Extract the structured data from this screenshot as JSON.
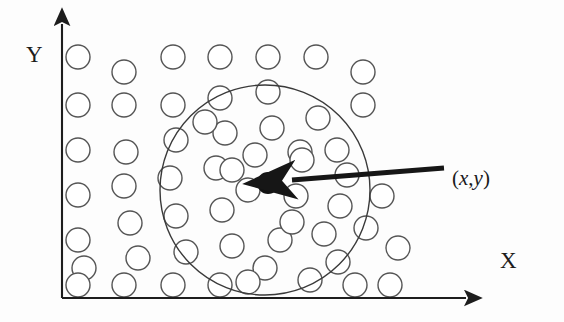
{
  "figure": {
    "type": "scatter-diagram",
    "title": "",
    "background_color": "#fdfdfd",
    "ink_color": "#2b2b2b",
    "axes": {
      "x_label": "X",
      "y_label": "Y",
      "origin": [
        62,
        298
      ],
      "x_axis_end": [
        472,
        298
      ],
      "y_axis_end": [
        62,
        18
      ],
      "arrowheads": "both-ends-outward",
      "color": "#1d1d1d"
    },
    "annotation": {
      "point_label": "(x,y)",
      "label_open_paren": "(",
      "label_x": "x",
      "label_comma": ",",
      "label_y": "y",
      "label_close_paren": ")",
      "arrow_from": [
        444,
        168
      ],
      "arrow_to": [
        283,
        181
      ],
      "arrow_color": "#161616"
    },
    "center_point": {
      "name": "query-point",
      "cx": 268,
      "cy": 183,
      "r": 11,
      "fill": "#121212"
    },
    "neighborhood_circle": {
      "name": "radius-region",
      "cx": 265,
      "cy": 190,
      "r": 105,
      "stroke": "#3a3a3a",
      "stroke_width": 1.4,
      "fill": "none"
    },
    "data_points": {
      "marker": "hollow-circle",
      "radius": 12,
      "stroke": "#555555",
      "stroke_width": 1.4,
      "fill": "#ffffff",
      "count": 57,
      "coordinates": [
        [
          78,
          57
        ],
        [
          124,
          72
        ],
        [
          173,
          57
        ],
        [
          220,
          57
        ],
        [
          268,
          57
        ],
        [
          316,
          57
        ],
        [
          363,
          72
        ],
        [
          78,
          105
        ],
        [
          124,
          105
        ],
        [
          173,
          105
        ],
        [
          220,
          98
        ],
        [
          268,
          92
        ],
        [
          318,
          118
        ],
        [
          363,
          105
        ],
        [
          78,
          150
        ],
        [
          126,
          152
        ],
        [
          176,
          140
        ],
        [
          225,
          133
        ],
        [
          272,
          128
        ],
        [
          300,
          152
        ],
        [
          337,
          150
        ],
        [
          78,
          195
        ],
        [
          124,
          186
        ],
        [
          170,
          178
        ],
        [
          216,
          168
        ],
        [
          255,
          155
        ],
        [
          302,
          160
        ],
        [
          347,
          175
        ],
        [
          78,
          240
        ],
        [
          130,
          223
        ],
        [
          176,
          216
        ],
        [
          222,
          210
        ],
        [
          248,
          190
        ],
        [
          296,
          196
        ],
        [
          340,
          206
        ],
        [
          382,
          196
        ],
        [
          84,
          268
        ],
        [
          138,
          258
        ],
        [
          186,
          252
        ],
        [
          232,
          246
        ],
        [
          280,
          240
        ],
        [
          324,
          234
        ],
        [
          366,
          228
        ],
        [
          398,
          248
        ],
        [
          78,
          285
        ],
        [
          124,
          285
        ],
        [
          173,
          285
        ],
        [
          220,
          285
        ],
        [
          265,
          268
        ],
        [
          310,
          280
        ],
        [
          355,
          285
        ],
        [
          390,
          285
        ],
        [
          232,
          170
        ],
        [
          205,
          122
        ],
        [
          292,
          222
        ],
        [
          338,
          262
        ],
        [
          248,
          282
        ]
      ]
    }
  }
}
